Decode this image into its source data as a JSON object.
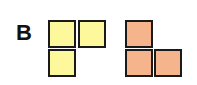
{
  "figure": {
    "label": "B",
    "shapes": [
      {
        "name": "yellow-L-tromino",
        "color": "#fdf89c",
        "cells": [
          [
            0,
            0
          ],
          [
            1,
            0
          ],
          [
            0,
            1
          ]
        ]
      },
      {
        "name": "orange-L-tromino",
        "color": "#f6b48c",
        "cells": [
          [
            0,
            0
          ],
          [
            0,
            1
          ],
          [
            1,
            1
          ]
        ]
      }
    ]
  }
}
